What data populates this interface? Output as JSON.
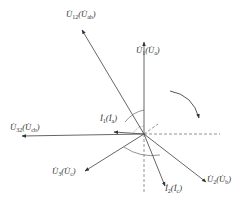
{
  "diagram": {
    "type": "phasor-diagram",
    "origin": [
      144,
      134
    ],
    "colors": {
      "line": "#555555",
      "dashed": "#777777",
      "text": "#333333"
    },
    "phasors": [
      {
        "id": "U1",
        "label": "U̇1 (U̇a)",
        "main": "U̇",
        "sub": "1",
        "alt_main": "U̇",
        "alt_sub": "a",
        "end": [
          144,
          42
        ],
        "label_pos": [
          136,
          46
        ]
      },
      {
        "id": "U12",
        "label": "U̇12 (U̇ab)",
        "main": "U̇",
        "sub": "12",
        "alt_main": "U̇",
        "alt_sub": "ab",
        "end": [
          82,
          30
        ],
        "label_pos": [
          66,
          10
        ]
      },
      {
        "id": "U32",
        "label": "U̇32 (U̇cb)",
        "main": "U̇",
        "sub": "32",
        "alt_main": "U̇",
        "alt_sub": "cb",
        "end": [
          22,
          136
        ],
        "label_pos": [
          10,
          123
        ]
      },
      {
        "id": "I1",
        "label": "İ1 (İa)",
        "main": "İ",
        "sub": "1",
        "alt_main": "İ",
        "alt_sub": "a",
        "end": [
          114,
          132
        ],
        "label_pos": [
          100,
          114
        ]
      },
      {
        "id": "U3",
        "label": "U̇3 (U̇c)",
        "main": "U̇",
        "sub": "3",
        "alt_main": "U̇",
        "alt_sub": "c",
        "end": [
          85,
          171
        ],
        "label_pos": [
          52,
          167
        ]
      },
      {
        "id": "I2",
        "label": "İ2 (İc)",
        "main": "İ",
        "sub": "2",
        "alt_main": "İ",
        "alt_sub": "c",
        "end": [
          165,
          186
        ],
        "label_pos": [
          165,
          184
        ]
      },
      {
        "id": "U2",
        "label": "U̇2 (U̇b)",
        "main": "U̇",
        "sub": "2",
        "alt_main": "U̇",
        "alt_sub": "b",
        "end": [
          206,
          182
        ],
        "label_pos": [
          207,
          175
        ]
      }
    ],
    "reference_lines": [
      {
        "name": "vertical-dashed",
        "from": [
          144,
          134
        ],
        "to": [
          144,
          192
        ]
      },
      {
        "name": "horizontal-dashed",
        "from": [
          144,
          134
        ],
        "to": [
          220,
          134
        ]
      },
      {
        "name": "diagonal-dashed",
        "from": [
          144,
          134
        ],
        "to": [
          158,
          124
        ]
      }
    ],
    "rotation_arrow": {
      "direction": "clockwise",
      "from": [
        170,
        91
      ],
      "to": [
        199,
        118
      ]
    }
  }
}
